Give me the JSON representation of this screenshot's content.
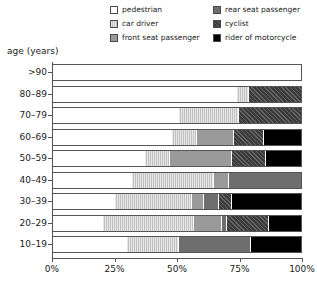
{
  "chart_data": {
    "type": "bar",
    "subtype": "stacked-horizontal-100-percent",
    "title": "",
    "xlabel": "",
    "ylabel": "age (years)",
    "xlim": [
      0,
      100
    ],
    "xticks": [
      "0%",
      "25%",
      "50%",
      "75%",
      "100%"
    ],
    "xtick_values": [
      0,
      25,
      50,
      75,
      100
    ],
    "grid": false,
    "legend_position": "top",
    "categories": [
      ">90",
      "80–89",
      "70–79",
      "60–69",
      "50–59",
      "40–49",
      "30–39",
      "20–29",
      "10–19"
    ],
    "series": [
      {
        "name": "pedestrian",
        "color": "#ffffff",
        "pattern": "solid",
        "values": [
          100,
          74,
          51,
          48,
          37,
          32,
          25,
          20,
          30
        ]
      },
      {
        "name": "car driver",
        "color": "#e8e8e8",
        "pattern": "fine-vertical-hatch",
        "values": [
          0,
          5,
          24,
          10,
          10,
          33,
          31,
          37,
          21
        ]
      },
      {
        "name": "front seat passenger",
        "color": "#9a9a9a",
        "pattern": "solid",
        "values": [
          0,
          0,
          0,
          15,
          25,
          6,
          5,
          11,
          0
        ]
      },
      {
        "name": "rear seat passenger",
        "color": "#6e6e6e",
        "pattern": "solid",
        "values": [
          0,
          0,
          0,
          0,
          0,
          29,
          6,
          2,
          29
        ]
      },
      {
        "name": "cyclist",
        "color": "#3a3a3a",
        "pattern": "diagonal-hatch",
        "values": [
          0,
          21,
          25,
          12,
          14,
          0,
          5,
          17,
          0
        ]
      },
      {
        "name": "rider of motorcycle",
        "color": "#000000",
        "pattern": "solid",
        "values": [
          0,
          0,
          0,
          15,
          14,
          0,
          28,
          13,
          20
        ]
      }
    ]
  },
  "legend": {
    "columns": [
      [
        {
          "label": "pedestrian",
          "key": "pedestrian"
        },
        {
          "label": "car driver",
          "key": "cardriver"
        },
        {
          "label": "front seat passenger",
          "key": "frontseat"
        }
      ],
      [
        {
          "label": "rear seat passenger",
          "key": "rearseat"
        },
        {
          "label": "cyclist",
          "key": "cyclist"
        },
        {
          "label": "rider of motorcycle",
          "key": "motorcycle"
        }
      ]
    ]
  },
  "axis": {
    "y_title": "age (years)"
  }
}
